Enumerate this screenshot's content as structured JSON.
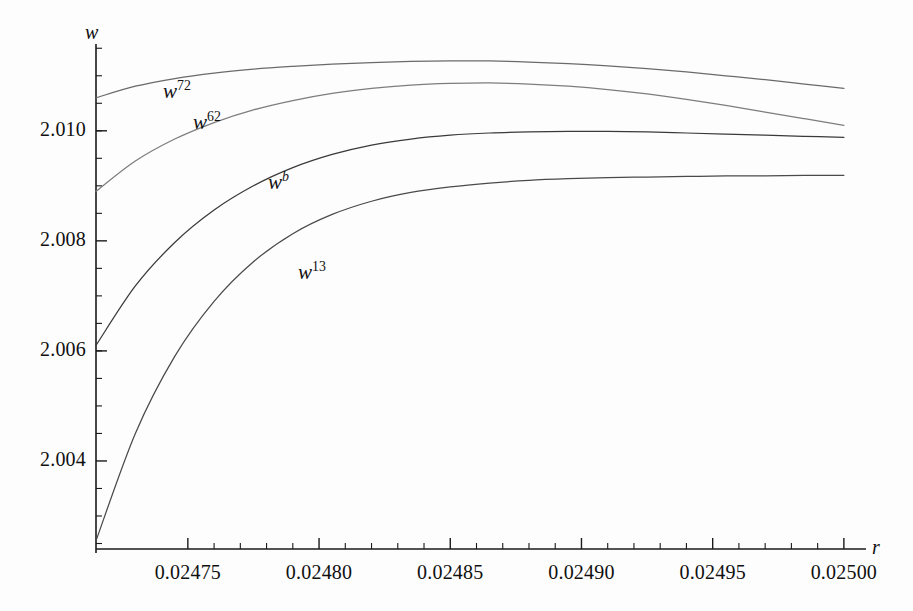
{
  "figure": {
    "background_color": "#fdfdfd",
    "axis_color": "#1a1a1a",
    "x_axis_name": "r",
    "y_axis_name": "w"
  },
  "axes": {
    "x_ticks": [
      "0.02475",
      "0.02480",
      "0.02485",
      "0.02490",
      "0.02495",
      "0.02500"
    ],
    "y_ticks": [
      "2.010",
      "2.008",
      "2.006",
      "2.004"
    ]
  },
  "curve_labels": [
    {
      "name": "w72",
      "base": "w",
      "sup": "72",
      "sup_italic": false,
      "x": 163,
      "y": 79
    },
    {
      "name": "w62",
      "base": "w",
      "sup": "62",
      "sup_italic": false,
      "x": 193,
      "y": 110
    },
    {
      "name": "wb",
      "base": "w",
      "sup": "b",
      "sup_italic": true,
      "x": 268,
      "y": 170
    },
    {
      "name": "w13",
      "base": "w",
      "sup": "13",
      "sup_italic": false,
      "x": 298,
      "y": 260
    }
  ],
  "chart_data": {
    "type": "line",
    "title": "",
    "xlabel": "r",
    "ylabel": "w",
    "xlim": [
      0.024715,
      0.025005
    ],
    "ylim": [
      2.0024,
      2.01165
    ],
    "grid": false,
    "legend": "inline-curve-labels",
    "xticks": [
      0.02475,
      0.0248,
      0.02485,
      0.0249,
      0.02495,
      0.025
    ],
    "xtick_labels": [
      "0.02475",
      "0.02480",
      "0.02485",
      "0.02490",
      "0.02495",
      "0.02500"
    ],
    "yticks": [
      2.004,
      2.006,
      2.008,
      2.01
    ],
    "ytick_labels": [
      "2.004",
      "2.006",
      "2.008",
      "2.010"
    ],
    "x": [
      0.024715,
      0.02473,
      0.024745,
      0.02476,
      0.024775,
      0.02479,
      0.024805,
      0.02482,
      0.024835,
      0.02485,
      0.024865,
      0.02488,
      0.024895,
      0.02491,
      0.024925,
      0.02494,
      0.024955,
      0.02497,
      0.024985,
      0.025
    ],
    "series": [
      {
        "name": "w72",
        "color": "#6a6a6a",
        "values": [
          2.0106,
          2.01081,
          2.01095,
          2.01105,
          2.01112,
          2.01117,
          2.01121,
          2.01124,
          2.01126,
          2.01127,
          2.01127,
          2.01125,
          2.01122,
          2.01118,
          2.01113,
          2.01107,
          2.011,
          2.01093,
          2.01085,
          2.01077
        ]
      },
      {
        "name": "w62",
        "color": "#7d7d7d",
        "values": [
          2.0089,
          2.00945,
          2.00985,
          2.01015,
          2.01038,
          2.01055,
          2.01068,
          2.01077,
          2.01083,
          2.01086,
          2.01087,
          2.01085,
          2.01081,
          2.01075,
          2.01067,
          2.01057,
          2.01046,
          2.01034,
          2.01022,
          2.0101
        ]
      },
      {
        "name": "wb",
        "color": "#3a3a3a",
        "values": [
          2.0061,
          2.00718,
          2.00797,
          2.00856,
          2.009,
          2.00933,
          2.00957,
          2.00974,
          2.00985,
          2.00992,
          2.00996,
          2.00998,
          2.00999,
          2.00999,
          2.00998,
          2.00996,
          2.00994,
          2.00992,
          2.0099,
          2.00988
        ]
      },
      {
        "name": "w13",
        "color": "#4a4a4a",
        "values": [
          2.00255,
          2.0045,
          2.0059,
          2.0069,
          2.00762,
          2.00813,
          2.00848,
          2.00872,
          2.00888,
          2.00898,
          2.00905,
          2.0091,
          2.00913,
          2.00915,
          2.00916,
          2.00917,
          2.00918,
          2.00918,
          2.00919,
          2.00919
        ]
      }
    ]
  }
}
